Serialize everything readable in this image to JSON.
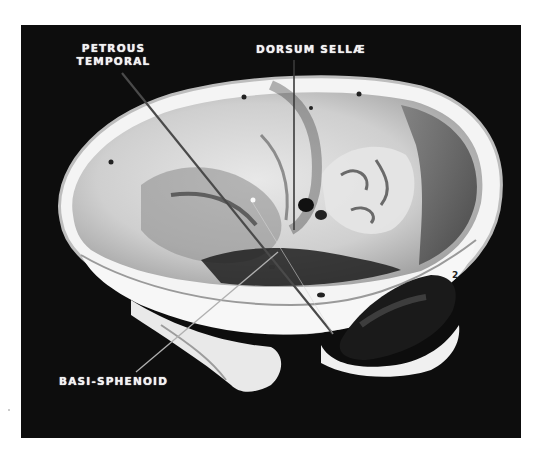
{
  "figure": {
    "background_color": "#ffffff",
    "photo_background_color": "#0d0d0d",
    "label_color": "#f2f2f2",
    "labels": {
      "petrous_temporal": {
        "line1": "PETROUS",
        "line2": "TEMPORAL"
      },
      "dorsum_sellae": {
        "text": "DORSUM SELLÆ"
      },
      "basi_sphenoid": {
        "text": "BASI-SPHENOID"
      }
    },
    "marks": {
      "numeral": "2"
    }
  }
}
